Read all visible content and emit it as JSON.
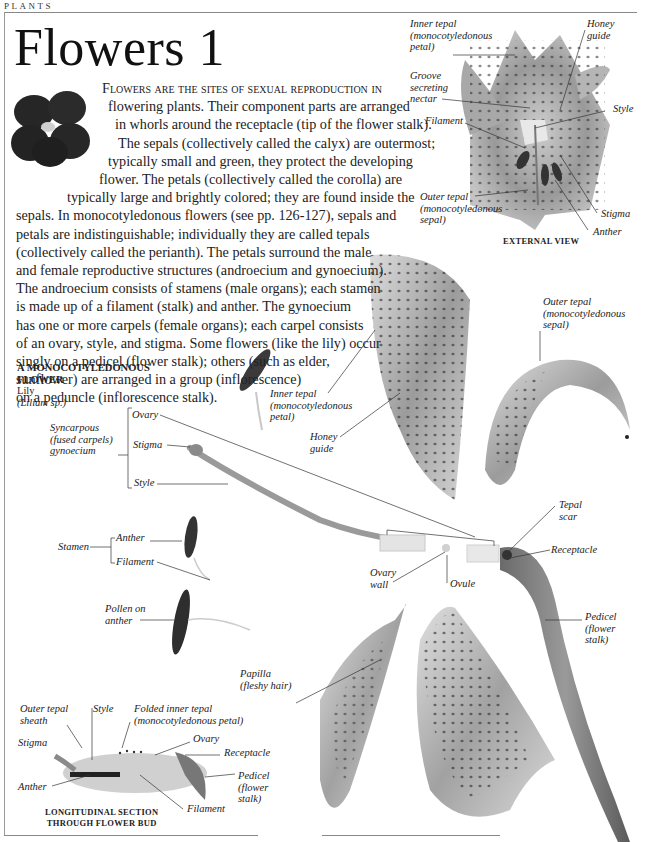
{
  "page": {
    "section": "PLANTS",
    "title": "Flowers 1"
  },
  "intro": {
    "lead": "Flowers are the sites of sexual reproduction in",
    "lines": [
      "flowering plants. Their component parts are arranged",
      "in whorls around the receptacle (tip of the flower stalk).",
      "The sepals (collectively called the calyx) are outermost;",
      "typically small and green, they protect the developing",
      "flower. The petals (collectively called the corolla) are",
      "typically large and brightly colored; they are found inside the",
      "sepals. In monocotyledonous flowers (see pp. 126-127), sepals and",
      "petals are indistinguishable; individually they are called tepals",
      "(collectively called the perianth). The petals surround the male",
      "and female reproductive structures (androecium and gynoecium).",
      "The androecium consists of stamens (male organs); each stamen",
      "is made up of a filament (stalk) and anther. The gynoecium",
      "has one or more carpels (female organs); each carpel consists",
      "of an ovary, style, and stigma. Some flowers (like the lily) occur",
      "singly on a pedicel (flower stalk); others (such as elder,",
      "sunflower) are arranged in a group (inflorescence)",
      "on a peduncle (inflorescence stalk)."
    ]
  },
  "specimen": {
    "heading_line1": "A MONOCOTYLEDONOUS",
    "heading_line2": "FLOWER",
    "common_name": "Lily",
    "scientific_name": "(Lilium sp.)"
  },
  "external_view": {
    "caption": "EXTERNAL VIEW",
    "labels": {
      "inner_tepal": [
        "Inner tepal",
        "(monocotyledonous",
        "petal)"
      ],
      "honey_guide": [
        "Honey",
        "guide"
      ],
      "groove": [
        "Groove",
        "secreting",
        "nectar"
      ],
      "style": "Style",
      "filament": "Filament",
      "outer_tepal": [
        "Outer tepal",
        "(monocotyledonous",
        "sepal)"
      ],
      "stigma": "Stigma",
      "anther": "Anther"
    }
  },
  "dissection": {
    "gynoecium_group": [
      "Syncarpous",
      "(fused carpels)",
      "gynoecium"
    ],
    "gynoecium_parts": {
      "ovary": "Ovary",
      "stigma": "Stigma",
      "style": "Style"
    },
    "stamen_group": "Stamen",
    "stamen_parts": {
      "anther": "Anther",
      "filament": "Filament"
    },
    "pollen": [
      "Pollen on",
      "anther"
    ],
    "inner_tepal": [
      "Inner tepal",
      "(monocotyledonous",
      "petal)"
    ],
    "honey_guide": [
      "Honey",
      "guide"
    ],
    "outer_tepal": [
      "Outer tepal",
      "(monocotyledonous",
      "sepal)"
    ],
    "tepal_scar": [
      "Tepal",
      "scar"
    ],
    "receptacle": "Receptacle",
    "ovary_wall": [
      "Ovary",
      "wall"
    ],
    "ovule": "Ovule",
    "pedicel": [
      "Pedicel",
      "(flower",
      "stalk)"
    ],
    "papilla": [
      "Papilla",
      "(fleshy hair)"
    ]
  },
  "bud_section": {
    "caption_line1": "LONGITUDINAL SECTION",
    "caption_line2": "THROUGH FLOWER BUD",
    "labels": {
      "outer_tepal_sheath": [
        "Outer tepal",
        "sheath"
      ],
      "style": "Style",
      "folded_inner_tepal": [
        "Folded inner tepal",
        "(monocotyledonous petal)"
      ],
      "stigma": "Stigma",
      "ovary": "Ovary",
      "receptacle": "Receptacle",
      "anther": "Anther",
      "pedicel": [
        "Pedicel",
        "(flower",
        "stalk)"
      ],
      "filament": "Filament"
    }
  },
  "colors": {
    "text": "#1a1a1a",
    "rule": "#888888",
    "specimen_dark": "#2e2e2e",
    "specimen_mid": "#8a8a8a",
    "specimen_light": "#d6d6d6"
  }
}
